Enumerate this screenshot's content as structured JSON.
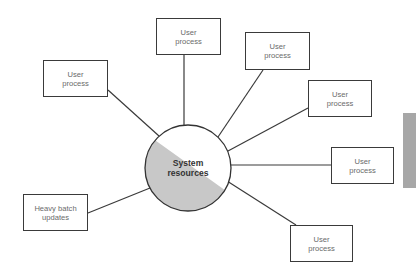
{
  "diagram": {
    "type": "hub-and-spoke",
    "center": {
      "label": "System\nresources",
      "fill_color": "#c8c8c8",
      "stroke_color": "#333333"
    },
    "nodes": [
      {
        "id": "top",
        "label": "User\nprocess"
      },
      {
        "id": "upper-right",
        "label": "User\nprocess"
      },
      {
        "id": "right-upper",
        "label": "User\nprocess"
      },
      {
        "id": "right",
        "label": "User\nprocess"
      },
      {
        "id": "lower-right",
        "label": "User\nprocess"
      },
      {
        "id": "left",
        "label": "User\nprocess"
      },
      {
        "id": "lower-left",
        "label": "Heavy batch\nupdates"
      }
    ],
    "colors": {
      "line": "#3a3a3a",
      "text": "#6a6a6a",
      "side_bar": "#a7a7a7"
    }
  }
}
